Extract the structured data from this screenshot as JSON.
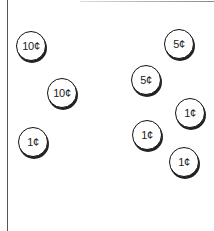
{
  "coins": [
    {
      "label": "10¢",
      "value_cents": 10,
      "x": 16,
      "y": 31
    },
    {
      "label": "10¢",
      "value_cents": 10,
      "x": 47,
      "y": 78
    },
    {
      "label": "1¢",
      "value_cents": 1,
      "x": 18,
      "y": 127
    },
    {
      "label": "5¢",
      "value_cents": 5,
      "x": 164,
      "y": 29
    },
    {
      "label": "5¢",
      "value_cents": 5,
      "x": 131,
      "y": 65
    },
    {
      "label": "1¢",
      "value_cents": 1,
      "x": 175,
      "y": 98
    },
    {
      "label": "1¢",
      "value_cents": 1,
      "x": 132,
      "y": 120
    },
    {
      "label": "1¢",
      "value_cents": 1,
      "x": 169,
      "y": 147
    }
  ]
}
